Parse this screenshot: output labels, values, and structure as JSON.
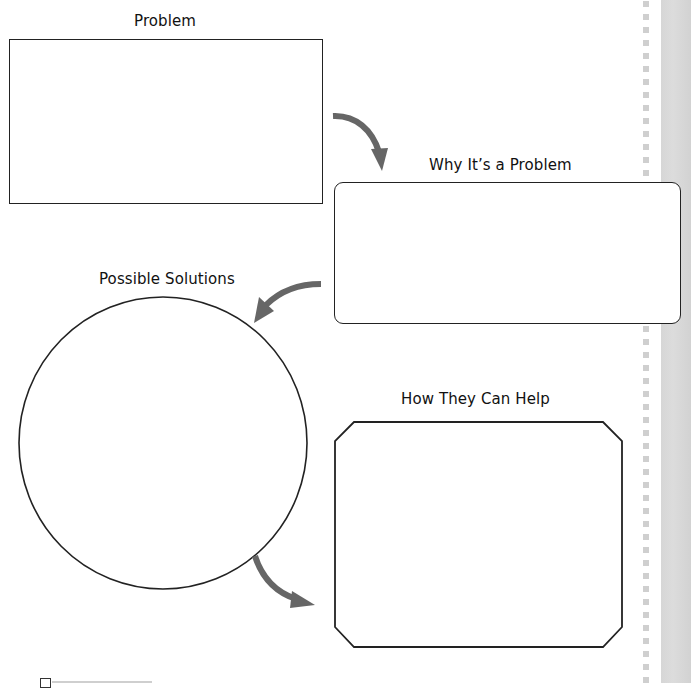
{
  "page": {
    "background": "#ffffff",
    "margin_band_color": "#d6d6d6",
    "margin_dots_color": "#cfcfcf"
  },
  "organizer": {
    "arrow_color": "#666666",
    "outline_color": "#222222",
    "sections": [
      {
        "id": "problem",
        "label": "Problem",
        "shape": "rectangle"
      },
      {
        "id": "why",
        "label": "Why It’s a Problem",
        "shape": "rounded-rectangle"
      },
      {
        "id": "solutions",
        "label": "Possible Solutions",
        "shape": "ellipse"
      },
      {
        "id": "help",
        "label": "How They Can Help",
        "shape": "octagon"
      }
    ],
    "arrows": [
      {
        "from": "problem",
        "to": "why",
        "icon": "curved-arrow-down-right-icon"
      },
      {
        "from": "why",
        "to": "solutions",
        "icon": "curved-arrow-down-left-icon"
      },
      {
        "from": "solutions",
        "to": "help",
        "icon": "curved-arrow-down-right-icon"
      }
    ]
  }
}
